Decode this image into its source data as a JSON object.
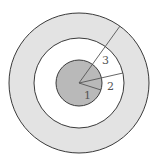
{
  "diagram": {
    "center": {
      "x": 79,
      "y": 83
    },
    "colors": {
      "outer_ring": "#e3e3e3",
      "middle_disk": "#ffffff",
      "inner_disk": "#b9b9b9",
      "stroke": "#3a3a3a",
      "radius_line": "#555555"
    },
    "circles": [
      {
        "name": "outer",
        "r": 70
      },
      {
        "name": "middle",
        "r": 45
      },
      {
        "name": "inner",
        "r": 23
      }
    ],
    "radii": [
      {
        "label": "1",
        "end": {
          "x": 101,
          "y": 90
        },
        "label_pos": {
          "x": 84,
          "y": 99
        }
      },
      {
        "label": "2",
        "end": {
          "x": 123,
          "y": 73
        },
        "label_pos": {
          "x": 107,
          "y": 89
        }
      },
      {
        "label": "3",
        "end": {
          "x": 120,
          "y": 26
        },
        "label_pos": {
          "x": 102,
          "y": 64
        }
      }
    ]
  }
}
